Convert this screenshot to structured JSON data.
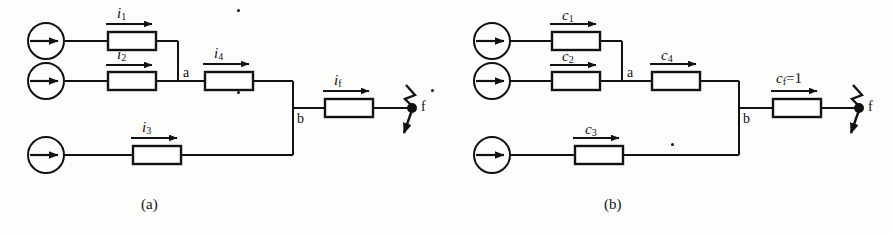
{
  "figure": {
    "background_color": "#fdfdfc",
    "line_color": "#111111",
    "width": 892,
    "height": 235
  },
  "panels": [
    {
      "id": "a",
      "caption": "(a)",
      "node_labels": {
        "a": "a",
        "b": "b",
        "fault": "f"
      },
      "branches": [
        {
          "id": "branch-1",
          "label_base": "i",
          "label_sub": "1",
          "has_phasor_dot": true,
          "source": "current-source"
        },
        {
          "id": "branch-2",
          "label_base": "i",
          "label_sub": "2",
          "has_phasor_dot": true,
          "source": "current-source"
        },
        {
          "id": "branch-3",
          "label_base": "i",
          "label_sub": "3",
          "has_phasor_dot": true,
          "source": "current-source"
        },
        {
          "id": "branch-4",
          "label_base": "i",
          "label_sub": "4",
          "has_phasor_dot": true,
          "source": null
        },
        {
          "id": "branch-fault",
          "label_base": "i",
          "label_sub": "f",
          "has_phasor_dot": true,
          "source": null
        }
      ]
    },
    {
      "id": "b",
      "caption": "(b)",
      "node_labels": {
        "a": "a",
        "b": "b",
        "fault": "f"
      },
      "branches": [
        {
          "id": "branch-1",
          "label_base": "c",
          "label_sub": "1",
          "label_suffix": "",
          "has_phasor_dot": false,
          "source": "current-source"
        },
        {
          "id": "branch-2",
          "label_base": "c",
          "label_sub": "2",
          "label_suffix": "",
          "has_phasor_dot": false,
          "source": "current-source"
        },
        {
          "id": "branch-3",
          "label_base": "c",
          "label_sub": "3",
          "label_suffix": "",
          "has_phasor_dot": false,
          "source": "current-source"
        },
        {
          "id": "branch-4",
          "label_base": "c",
          "label_sub": "4",
          "label_suffix": "",
          "has_phasor_dot": false,
          "source": null
        },
        {
          "id": "branch-fault",
          "label_base": "c",
          "label_sub": "f",
          "label_suffix": "=1",
          "has_phasor_dot": false,
          "source": null
        }
      ]
    }
  ],
  "labels": {
    "a_i1_base": "i",
    "a_i1_sub": "1",
    "a_i2_base": "i",
    "a_i2_sub": "2",
    "a_i3_base": "i",
    "a_i3_sub": "3",
    "a_i4_base": "i",
    "a_i4_sub": "4",
    "a_if_base": "i",
    "a_if_sub": "f",
    "a_node_a": "a",
    "a_node_b": "b",
    "a_fault": "f",
    "a_caption": "(a)",
    "b_c1_base": "c",
    "b_c1_sub": "1",
    "b_c2_base": "c",
    "b_c2_sub": "2",
    "b_c3_base": "c",
    "b_c3_sub": "3",
    "b_c4_base": "c",
    "b_c4_sub": "4",
    "b_cf_base": "c",
    "b_cf_sub": "f",
    "b_cf_suffix": "=1",
    "b_node_a": "a",
    "b_node_b": "b",
    "b_fault": "f",
    "b_caption": "(b)"
  }
}
